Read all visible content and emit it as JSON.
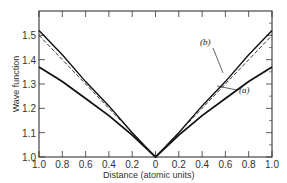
{
  "chart_data": {
    "type": "line",
    "title": "",
    "xlabel": "Distance (atomic units)",
    "ylabel": "Wave function",
    "xlim": [
      -1.0,
      1.0
    ],
    "ylim": [
      1.0,
      1.6
    ],
    "x_tick_labels": [
      "1.0",
      "0.8",
      "0.6",
      "0.4",
      "0.2",
      "0",
      "0.2",
      "0.4",
      "0.6",
      "0.8",
      "1.0"
    ],
    "y_tick_labels": [
      "1.0",
      "1.1",
      "1.2",
      "1.3",
      "1.4",
      "1.5"
    ],
    "grid": false,
    "x": [
      -1.0,
      -0.8,
      -0.6,
      -0.4,
      -0.2,
      0.0,
      0.2,
      0.4,
      0.6,
      0.8,
      1.0
    ],
    "series": [
      {
        "name": "(a)",
        "style": "solid-thick",
        "values": [
          1.37,
          1.31,
          1.24,
          1.17,
          1.09,
          1.0,
          1.09,
          1.17,
          1.24,
          1.31,
          1.37
        ]
      },
      {
        "name": "(b)",
        "style": "solid",
        "values": [
          1.52,
          1.42,
          1.31,
          1.21,
          1.1,
          1.0,
          1.1,
          1.21,
          1.31,
          1.42,
          1.52
        ]
      },
      {
        "name": "exact",
        "style": "dashed",
        "values": [
          1.5,
          1.4,
          1.3,
          1.2,
          1.1,
          1.0,
          1.1,
          1.2,
          1.3,
          1.4,
          1.5
        ]
      }
    ],
    "annotations": [
      {
        "text": "(b)",
        "points_to": "series b",
        "x": 0.62,
        "y": 1.38
      },
      {
        "text": "(a)",
        "points_to": "series a",
        "x": 0.72,
        "y": 1.28
      }
    ]
  },
  "labels": {
    "xlabel": "Distance (atomic units)",
    "ylabel": "Wave function",
    "annot_a": "(a)",
    "annot_b": "(b)"
  }
}
